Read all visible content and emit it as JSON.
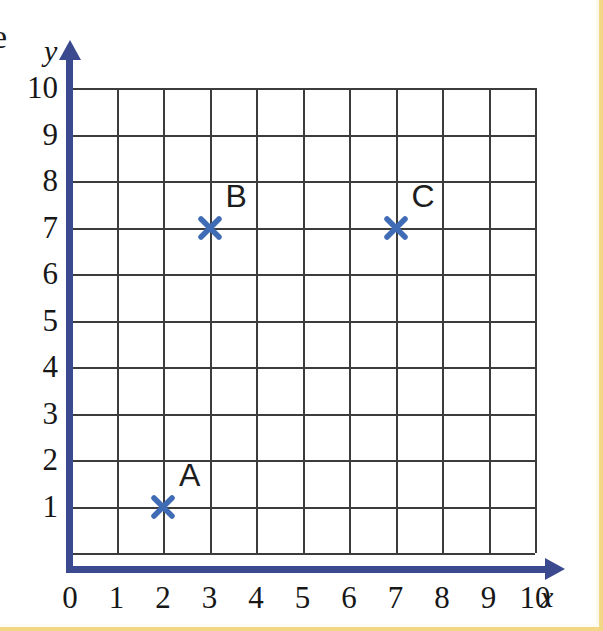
{
  "page": {
    "stray_glyph": "e",
    "frame_color": "#f2d785",
    "background": "#ffffff"
  },
  "chart_data": {
    "type": "scatter",
    "title": "",
    "xlabel": "x",
    "ylabel": "y",
    "xlim": [
      0,
      10
    ],
    "ylim": [
      0,
      10
    ],
    "grid": true,
    "legend": "none",
    "x_ticks": [
      "0",
      "1",
      "2",
      "3",
      "4",
      "5",
      "6",
      "7",
      "8",
      "9",
      "10"
    ],
    "y_ticks": [
      "1",
      "2",
      "3",
      "4",
      "5",
      "6",
      "7",
      "8",
      "9",
      "10"
    ],
    "marker_style": "cross-x",
    "marker_color": "#3f6cb4",
    "axis_color": "#3b4a8e",
    "grid_color": "#3c3c3c",
    "points": [
      {
        "label": "A",
        "x": 2,
        "y": 1
      },
      {
        "label": "B",
        "x": 3,
        "y": 7
      },
      {
        "label": "C",
        "x": 7,
        "y": 7
      }
    ]
  }
}
